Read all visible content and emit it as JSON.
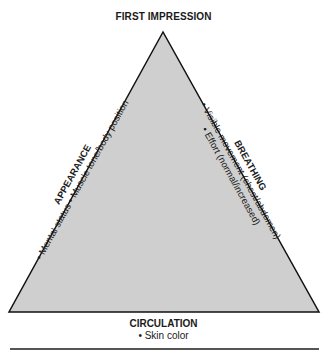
{
  "diagram": {
    "title": "FIRST IMPRESSION",
    "shape": "triangle",
    "fill_color": "#cfcfcf",
    "stroke_color": "#111111",
    "sides": {
      "left": {
        "heading": "APPEARANCE",
        "items_line": "• Mental status • Muscle tone/body position"
      },
      "right": {
        "heading": "BREATHING",
        "item1": "• Visible movement (chest/abdomen)",
        "item2": "• Effort (normal/increased)"
      },
      "bottom": {
        "heading": "CIRCULATION",
        "item1": "• Skin color"
      }
    }
  }
}
